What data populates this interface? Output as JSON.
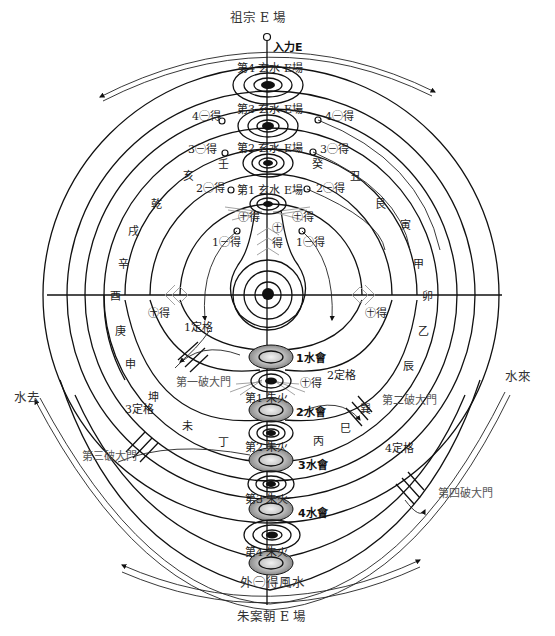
{
  "title_top": "祖宗 E 場",
  "title_bottom": "朱案朝 E 場",
  "input_label": "入力E",
  "water_out": "水去",
  "water_in": "水來",
  "outer_gain": "外㊀得風水",
  "colors": {
    "line": "#111111",
    "gray_shade": "#8a8a8a",
    "light_shade": "#cfcfcf"
  },
  "xuanshui_fields": [
    {
      "id": 4,
      "label": "第4 玄水 E場"
    },
    {
      "id": 3,
      "label": "第3 玄水 E場"
    },
    {
      "id": 2,
      "label": "第2 玄水 E場"
    },
    {
      "id": 1,
      "label": "第1 玄水 E場"
    }
  ],
  "zhuhuo": [
    {
      "id": 1,
      "label": "第1 朱火"
    },
    {
      "id": 2,
      "label": "第2 朱火"
    },
    {
      "id": 3,
      "label": "第3 朱火"
    },
    {
      "id": 4,
      "label": "第4 朱火"
    }
  ],
  "shuihui": [
    "1水會",
    "2水會",
    "3水會",
    "4水會"
  ],
  "gain_left": [
    "4㊀得",
    "3㊀得",
    "2㊀得",
    "1㊀得"
  ],
  "gain_right": [
    "4㊀得",
    "3㊀得",
    "2㊀得",
    "1㊀得"
  ],
  "plus_gain": [
    "㊉得",
    "㊉得",
    "㊉得",
    "㊉得",
    "㊉得",
    "㊉得",
    "㊉得"
  ],
  "center_plus": "㊉",
  "center_gain": "得",
  "dingge": [
    "1定格",
    "2定格",
    "3定格",
    "4定格"
  ],
  "gates": [
    "第一破大門",
    "第二破大門",
    "第三破大門",
    "第四破大門"
  ],
  "directions_left": [
    "壬",
    "亥",
    "乾",
    "戌",
    "辛",
    "酉",
    "庚",
    "申",
    "坤",
    "未",
    "丁"
  ],
  "directions_right": [
    "癸",
    "丑",
    "艮",
    "寅",
    "甲",
    "卯",
    "乙",
    "辰",
    "巽",
    "巳",
    "丙"
  ]
}
